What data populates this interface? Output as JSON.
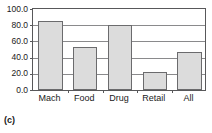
{
  "chart_data": {
    "type": "bar",
    "title": "",
    "xlabel": "",
    "ylabel": "",
    "categories": [
      "Mach",
      "Food",
      "Drug",
      "Retail",
      "All"
    ],
    "values": [
      85.0,
      53.0,
      80.5,
      22.0,
      47.0
    ],
    "ylim": [
      0.0,
      100.0
    ],
    "ytick_labels": [
      "100.0",
      "80.0",
      "60.0",
      "40.0",
      "20.0",
      "0.0"
    ],
    "ytick_values": [
      100.0,
      80.0,
      60.0,
      40.0,
      20.0,
      0.0
    ],
    "grid": true,
    "legend": "none",
    "bar_fill_color": "#dcdcdc",
    "bar_border_color": "#6b6b6d",
    "axis_color": "#58585a",
    "gridline_color": "#8a8a8c"
  },
  "caption": "(c)"
}
